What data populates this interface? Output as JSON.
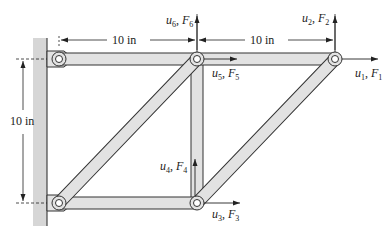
{
  "diagram": {
    "type": "truss",
    "colors": {
      "member_fill": "#e2e2e2",
      "member_stroke": "#333333",
      "wall_fill": "#d6d6d6",
      "line": "#222222"
    },
    "dimensions": {
      "top_left_span": "10 in",
      "top_right_span": "10 in",
      "vertical_height": "10 in"
    },
    "dofs": [
      {
        "id": 1,
        "u": "u",
        "sub": "1",
        "F": "F",
        "fsub": "1",
        "direction": "right",
        "node": "top-right"
      },
      {
        "id": 2,
        "u": "u",
        "sub": "2",
        "F": "F",
        "fsub": "2",
        "direction": "up",
        "node": "top-right"
      },
      {
        "id": 3,
        "u": "u",
        "sub": "3",
        "F": "F",
        "fsub": "3",
        "direction": "right",
        "node": "bottom-middle"
      },
      {
        "id": 4,
        "u": "u",
        "sub": "4",
        "F": "F",
        "fsub": "4",
        "direction": "up",
        "node": "bottom-middle"
      },
      {
        "id": 5,
        "u": "u",
        "sub": "5",
        "F": "F",
        "fsub": "5",
        "direction": "right",
        "node": "top-middle"
      },
      {
        "id": 6,
        "u": "u",
        "sub": "6",
        "F": "F",
        "fsub": "6",
        "direction": "up",
        "node": "top-middle"
      }
    ],
    "nodes": [
      "top-left (pinned)",
      "top-middle",
      "top-right",
      "bottom-left (pinned)",
      "bottom-middle"
    ],
    "members": [
      "top-left to top-middle",
      "top-middle to top-right",
      "bottom-left to bottom-middle",
      "bottom-left to top-middle",
      "bottom-middle to top-middle",
      "bottom-middle to top-right"
    ]
  }
}
